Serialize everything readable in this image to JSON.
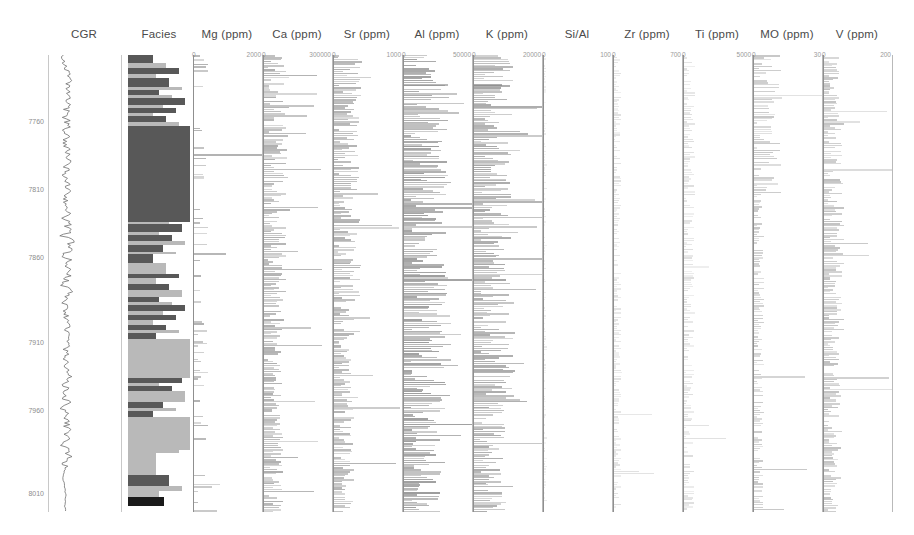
{
  "figure": {
    "kind": "well-log-composite",
    "depth_axis": {
      "label_values": [
        "7760",
        "7810",
        "7860",
        "7910",
        "7960",
        "8010"
      ],
      "label_y": [
        122,
        190,
        258,
        343,
        411,
        494
      ],
      "top_depth": 7735,
      "bottom_depth": 8020
    }
  },
  "chart_data": {
    "type": "line",
    "title": "",
    "xlabel": "",
    "ylabel": "Depth (ft)",
    "ylim": [
      8020,
      7735
    ],
    "grid": false,
    "legend": "none",
    "tracks": [
      {
        "name": "CGR",
        "title": "CGR",
        "type": "curve",
        "axis_min": "",
        "axis_max": "",
        "x": 48,
        "width": 72,
        "color": "#6e6e6e"
      },
      {
        "name": "Facies",
        "title": "Facies",
        "type": "facies",
        "axis_min": "",
        "axis_max": "",
        "x": 128,
        "width": 62,
        "colors": {
          "dark": "#585858",
          "light": "#b9b9b9",
          "black": "#1a1a1a",
          "blank": "#ffffff"
        }
      },
      {
        "name": "Mg",
        "title": "Mg (ppm)",
        "type": "bar",
        "axis_min": "0",
        "axis_max": "2000",
        "x": 193,
        "width": 68,
        "color": "#8a8a8a"
      },
      {
        "name": "Ca",
        "title": "Ca (ppm)",
        "type": "bar",
        "axis_min": "0",
        "axis_max": "300000",
        "x": 263,
        "width": 68,
        "color": "#858585"
      },
      {
        "name": "Sr",
        "title": "Sr (ppm)",
        "type": "bar",
        "axis_min": "0",
        "axis_max": "1000",
        "x": 333,
        "width": 68,
        "color": "#8a8a8a"
      },
      {
        "name": "Al",
        "title": "Al (ppm)",
        "type": "bar",
        "axis_min": "0",
        "axis_max": "50000",
        "x": 403,
        "width": 68,
        "color": "#7b7b7b"
      },
      {
        "name": "K",
        "title": "K (ppm)",
        "type": "bar",
        "axis_min": "0",
        "axis_max": "20000",
        "x": 473,
        "width": 68,
        "color": "#828282"
      },
      {
        "name": "SiAl",
        "title": "Si/Al",
        "type": "bar",
        "axis_min": "0",
        "axis_max": "100",
        "x": 543,
        "width": 68,
        "color": "#bdbdbd"
      },
      {
        "name": "Zr",
        "title": "Zr (ppm)",
        "type": "bar",
        "axis_min": "0",
        "axis_max": "700",
        "x": 613,
        "width": 68,
        "color": "#b3b3b3"
      },
      {
        "name": "Ti",
        "title": "Ti (ppm)",
        "type": "bar",
        "axis_min": "0",
        "axis_max": "5000",
        "x": 683,
        "width": 68,
        "color": "#b0b0b0"
      },
      {
        "name": "MO",
        "title": "MO (ppm)",
        "type": "bar",
        "axis_min": "0",
        "axis_max": "30",
        "x": 753,
        "width": 68,
        "color": "#9a9a9a"
      },
      {
        "name": "V",
        "title": "V (ppm)",
        "type": "bar",
        "axis_min": "0",
        "axis_max": "200",
        "x": 823,
        "width": 68,
        "color": "#969696"
      }
    ],
    "facies_blocks": [
      {
        "y": 55,
        "h": 8,
        "c": "dark"
      },
      {
        "y": 63,
        "h": 5,
        "c": "light"
      },
      {
        "y": 68,
        "h": 6,
        "c": "dark"
      },
      {
        "y": 74,
        "h": 4,
        "c": "light"
      },
      {
        "y": 78,
        "h": 9,
        "c": "dark"
      },
      {
        "y": 87,
        "h": 3,
        "c": "light"
      },
      {
        "y": 90,
        "h": 5,
        "c": "dark"
      },
      {
        "y": 95,
        "h": 3,
        "c": "light"
      },
      {
        "y": 98,
        "h": 7,
        "c": "dark"
      },
      {
        "y": 105,
        "h": 3,
        "c": "light"
      },
      {
        "y": 108,
        "h": 5,
        "c": "dark"
      },
      {
        "y": 113,
        "h": 3,
        "c": "light"
      },
      {
        "y": 116,
        "h": 6,
        "c": "dark"
      },
      {
        "y": 122,
        "h": 4,
        "c": "light"
      },
      {
        "y": 126,
        "h": 96,
        "c": "dark"
      },
      {
        "y": 222,
        "h": 2,
        "c": "light"
      },
      {
        "y": 224,
        "h": 8,
        "c": "dark"
      },
      {
        "y": 232,
        "h": 3,
        "c": "light"
      },
      {
        "y": 235,
        "h": 6,
        "c": "dark"
      },
      {
        "y": 241,
        "h": 4,
        "c": "light"
      },
      {
        "y": 245,
        "h": 7,
        "c": "dark"
      },
      {
        "y": 252,
        "h": 2,
        "c": "light"
      },
      {
        "y": 254,
        "h": 9,
        "c": "dark"
      },
      {
        "y": 263,
        "h": 11,
        "c": "light"
      },
      {
        "y": 274,
        "h": 4,
        "c": "dark"
      },
      {
        "y": 278,
        "h": 6,
        "c": "light"
      },
      {
        "y": 284,
        "h": 6,
        "c": "dark"
      },
      {
        "y": 290,
        "h": 7,
        "c": "light"
      },
      {
        "y": 297,
        "h": 5,
        "c": "dark"
      },
      {
        "y": 302,
        "h": 3,
        "c": "light"
      },
      {
        "y": 305,
        "h": 6,
        "c": "dark"
      },
      {
        "y": 311,
        "h": 4,
        "c": "light"
      },
      {
        "y": 315,
        "h": 5,
        "c": "dark"
      },
      {
        "y": 320,
        "h": 5,
        "c": "light"
      },
      {
        "y": 325,
        "h": 5,
        "c": "dark"
      },
      {
        "y": 330,
        "h": 3,
        "c": "light"
      },
      {
        "y": 333,
        "h": 6,
        "c": "dark"
      },
      {
        "y": 339,
        "h": 39,
        "c": "light"
      },
      {
        "y": 378,
        "h": 5,
        "c": "dark"
      },
      {
        "y": 383,
        "h": 3,
        "c": "light"
      },
      {
        "y": 386,
        "h": 5,
        "c": "dark"
      },
      {
        "y": 391,
        "h": 11,
        "c": "light"
      },
      {
        "y": 402,
        "h": 6,
        "c": "dark"
      },
      {
        "y": 408,
        "h": 3,
        "c": "light"
      },
      {
        "y": 411,
        "h": 6,
        "c": "dark"
      },
      {
        "y": 417,
        "h": 33,
        "c": "light"
      },
      {
        "y": 450,
        "h": 3,
        "c": "light"
      },
      {
        "y": 453,
        "h": 22,
        "c": "light"
      },
      {
        "y": 475,
        "h": 11,
        "c": "dark"
      },
      {
        "y": 486,
        "h": 5,
        "c": "light"
      },
      {
        "y": 491,
        "h": 6,
        "c": "light"
      },
      {
        "y": 497,
        "h": 9,
        "c": "black"
      }
    ]
  }
}
